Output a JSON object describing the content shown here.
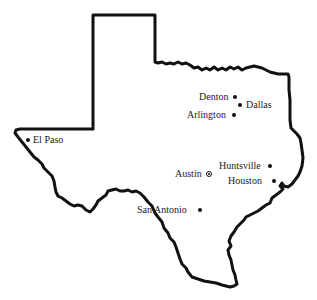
{
  "map": {
    "region": "Texas",
    "outline_color": "#111111",
    "cities": [
      {
        "name": "Denton",
        "label": "Denton",
        "dot_x": 235,
        "dot_y": 97,
        "label_x": 199,
        "label_y": 92,
        "type": "city"
      },
      {
        "name": "Dallas",
        "label": "Dallas",
        "dot_x": 240,
        "dot_y": 105,
        "label_x": 246,
        "label_y": 100,
        "type": "city"
      },
      {
        "name": "Arlington",
        "label": "Arlington",
        "dot_x": 234,
        "dot_y": 115,
        "label_x": 187,
        "label_y": 110,
        "type": "city"
      },
      {
        "name": "El Paso",
        "label": "El Paso",
        "dot_x": 28,
        "dot_y": 140,
        "label_x": 33,
        "label_y": 135,
        "type": "city"
      },
      {
        "name": "Huntsville",
        "label": "Huntsville",
        "dot_x": 270,
        "dot_y": 166,
        "label_x": 219,
        "label_y": 161,
        "type": "city"
      },
      {
        "name": "Austin",
        "label": "Austin",
        "dot_x": 209,
        "dot_y": 174,
        "label_x": 175,
        "label_y": 169,
        "type": "capital"
      },
      {
        "name": "Houston",
        "label": "Houston",
        "dot_x": 274,
        "dot_y": 181,
        "label_x": 228,
        "label_y": 176,
        "type": "city"
      },
      {
        "name": "San Antonio",
        "label": "San Antonio",
        "dot_x": 200,
        "dot_y": 210,
        "label_x": 137,
        "label_y": 205,
        "type": "city"
      }
    ]
  }
}
